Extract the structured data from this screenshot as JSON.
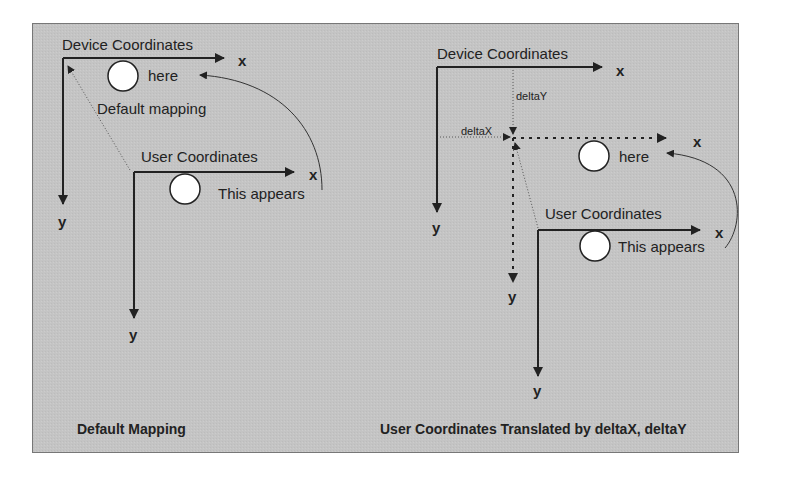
{
  "colors": {
    "panel_bg": "#c4c4c4",
    "panel_border": "#777777",
    "ink": "#222222",
    "circle_fill": "#ffffff"
  },
  "left_diagram": {
    "device_label": "Device Coordinates",
    "device_x_label": "x",
    "device_y_label": "y",
    "here_label": "here",
    "mapping_label": "Default mapping",
    "user_label": "User Coordinates",
    "user_x_label": "x",
    "user_y_label": "y",
    "appears_label": "This appears",
    "caption": "Default Mapping"
  },
  "right_diagram": {
    "device_label": "Device Coordinates",
    "device_x_label": "x",
    "device_y_label": "y",
    "delta_y_label": "deltaY",
    "delta_x_label": "deltaX",
    "translated_x_label": "x",
    "translated_y_label": "y",
    "here_label": "here",
    "user_label": "User Coordinates",
    "user_x_label": "x",
    "user_y_label": "y",
    "appears_label": "This appears",
    "caption": "User Coordinates Translated by deltaX, deltaY"
  }
}
